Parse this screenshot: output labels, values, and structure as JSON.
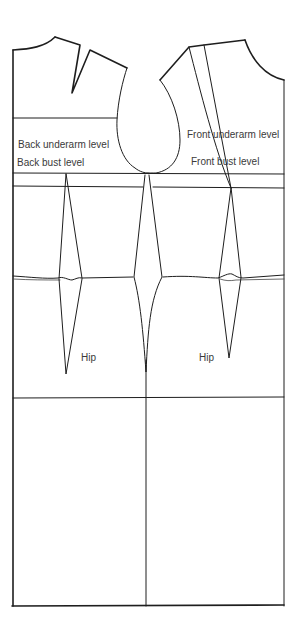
{
  "diagram": {
    "labels": {
      "back_underarm": "Back underarm level",
      "back_bust": "Back bust level",
      "front_underarm": "Front underarm level",
      "front_bust": "Front bust level",
      "hip_back": "Hip",
      "hip_front": "Hip"
    },
    "colors": {
      "line": "#1e1e1e",
      "text": "#3a3a3a",
      "background": "#ffffff"
    },
    "pieces": [
      "back",
      "front"
    ]
  }
}
